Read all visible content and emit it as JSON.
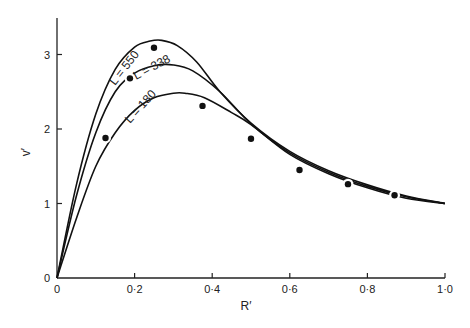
{
  "chart_data": {
    "type": "line",
    "title": "",
    "xlabel": "R′",
    "ylabel": "v′",
    "xlim": [
      0,
      1.0
    ],
    "ylim": [
      0,
      3.5
    ],
    "grid": false,
    "x_ticks": [
      0,
      0.2,
      0.4,
      0.6,
      0.8,
      1.0
    ],
    "x_tick_labels": [
      "0",
      "0·2",
      "0·4",
      "0·6",
      "0·8",
      "1·0"
    ],
    "y_ticks": [
      0,
      1,
      2,
      3
    ],
    "y_tick_labels": [
      "0",
      "1",
      "2",
      "3"
    ],
    "series": [
      {
        "name": "L = 550",
        "label": "L = 550",
        "style": "line",
        "x": [
          0,
          0.05,
          0.1,
          0.15,
          0.2,
          0.24,
          0.27,
          0.31,
          0.36,
          0.42,
          0.5,
          0.6,
          0.7,
          0.8,
          0.9,
          1.0
        ],
        "y": [
          0,
          1.25,
          2.2,
          2.8,
          3.1,
          3.18,
          3.19,
          3.12,
          2.9,
          2.5,
          2.08,
          1.7,
          1.44,
          1.25,
          1.1,
          1.0
        ]
      },
      {
        "name": "L = 338",
        "label": "L = 338",
        "style": "line",
        "x": [
          0,
          0.05,
          0.1,
          0.15,
          0.2,
          0.25,
          0.3,
          0.35,
          0.42,
          0.5,
          0.6,
          0.7,
          0.8,
          0.9,
          1.0
        ],
        "y": [
          0,
          1.1,
          1.95,
          2.5,
          2.75,
          2.85,
          2.86,
          2.78,
          2.5,
          2.07,
          1.68,
          1.42,
          1.23,
          1.09,
          1.0
        ]
      },
      {
        "name": "L = 180",
        "label": "L = 180",
        "style": "line",
        "x": [
          0,
          0.05,
          0.1,
          0.15,
          0.2,
          0.25,
          0.3,
          0.33,
          0.38,
          0.45,
          0.5,
          0.6,
          0.7,
          0.8,
          0.9,
          1.0
        ],
        "y": [
          0,
          0.8,
          1.5,
          1.95,
          2.25,
          2.42,
          2.48,
          2.48,
          2.42,
          2.22,
          2.06,
          1.66,
          1.4,
          1.21,
          1.07,
          1.0
        ]
      },
      {
        "name": "observed",
        "style": "scatter",
        "x": [
          0.125,
          0.188,
          0.25,
          0.375,
          0.5,
          0.625,
          0.75,
          0.87
        ],
        "y": [
          1.88,
          2.68,
          3.09,
          2.31,
          1.87,
          1.45,
          1.26,
          1.11
        ]
      }
    ]
  }
}
